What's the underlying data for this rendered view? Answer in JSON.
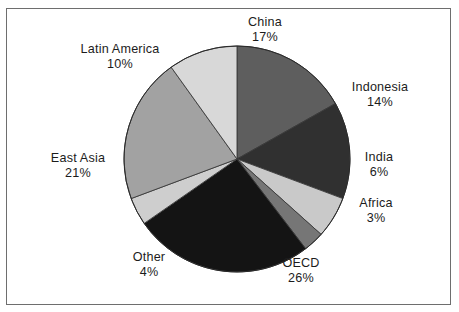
{
  "figure": {
    "type": "pie-chart-figure",
    "background_color": "#ffffff",
    "frame_color": "#6e6e6e",
    "text_color": "#1c1c1c"
  },
  "chart_data": {
    "type": "pie",
    "title": "",
    "subtitle": "",
    "xlabel": "",
    "ylabel": "",
    "legend_position": "none",
    "grid": false,
    "labels_show_percent": true,
    "start_angle_deg": 0,
    "direction": "clockwise",
    "categories": [
      "China",
      "Indonesia",
      "India",
      "Africa",
      "OECD",
      "Other",
      "East Asia",
      "Latin America"
    ],
    "values": [
      17,
      14,
      6,
      3,
      26,
      4,
      21,
      10
    ],
    "unit": "%",
    "total": 101,
    "slices": [
      {
        "label": "China",
        "value": 17,
        "value_text": "17%",
        "color": "#5e5e5e"
      },
      {
        "label": "Indonesia",
        "value": 14,
        "value_text": "14%",
        "color": "#303030"
      },
      {
        "label": "India",
        "value": 6,
        "value_text": "6%",
        "color": "#c9c9c9"
      },
      {
        "label": "Africa",
        "value": 3,
        "value_text": "3%",
        "color": "#767676"
      },
      {
        "label": "OECD",
        "value": 26,
        "value_text": "26%",
        "color": "#141414"
      },
      {
        "label": "Other",
        "value": 4,
        "value_text": "4%",
        "color": "#cecece"
      },
      {
        "label": "East Asia",
        "value": 21,
        "value_text": "21%",
        "color": "#a2a2a2"
      },
      {
        "label": "Latin America",
        "value": 10,
        "value_text": "10%",
        "color": "#d8d8d8"
      }
    ]
  },
  "labels": {
    "china": {
      "name": "China",
      "value": "17%"
    },
    "indonesia": {
      "name": "Indonesia",
      "value": "14%"
    },
    "india": {
      "name": "India",
      "value": "6%"
    },
    "africa": {
      "name": "Africa",
      "value": "3%"
    },
    "oecd": {
      "name": "OECD",
      "value": "26%"
    },
    "other": {
      "name": "Other",
      "value": "4%"
    },
    "east_asia": {
      "name": "East Asia",
      "value": "21%"
    },
    "latin_america": {
      "name": "Latin America",
      "value": "10%"
    }
  }
}
